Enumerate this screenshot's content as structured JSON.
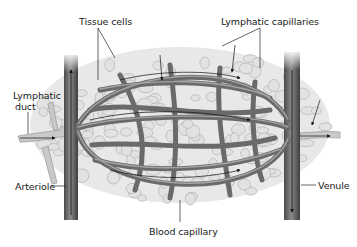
{
  "diagram": {
    "labels": {
      "tissue_cells": "Tissue cells",
      "lymphatic_capillaries": "Lymphatic capillaries",
      "lymphatic_duct_line1": "Lymphatic",
      "lymphatic_duct_line2": "duct",
      "arteriole": "Arteriole",
      "venule": "Venule",
      "blood_capillary": "Blood capillary"
    },
    "colors": {
      "vessel": "#5a5a5a",
      "vessel_highlight": "#8c8c8c",
      "tissue": "#d6d6d6",
      "lymph": "#bdbdbd",
      "leader": "#222222"
    }
  }
}
